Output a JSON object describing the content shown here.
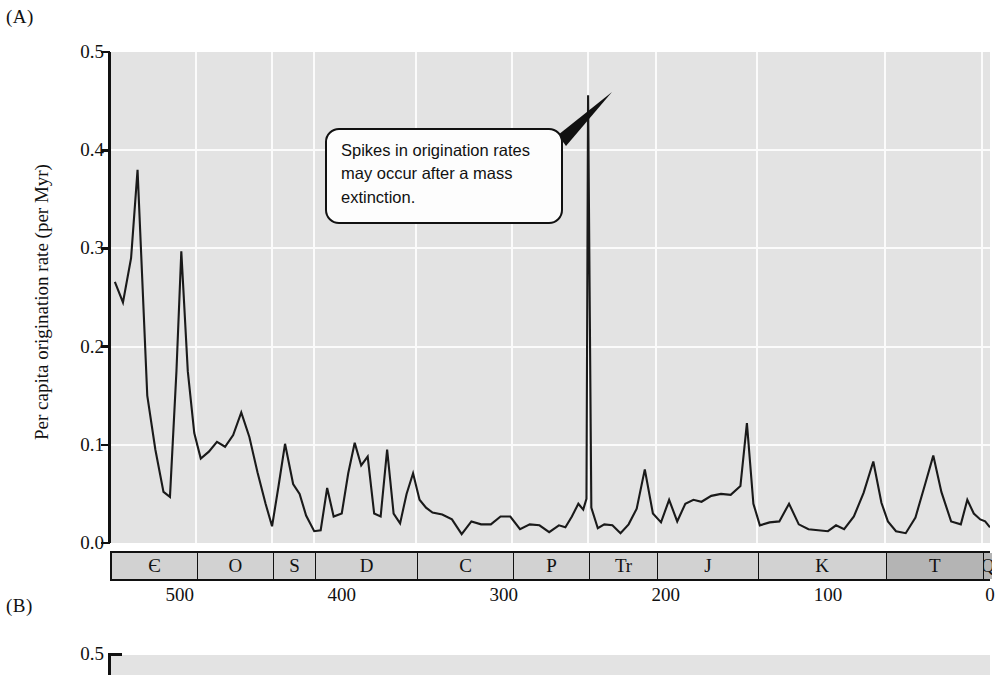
{
  "figure": {
    "panel_a_letter": "(A)",
    "panel_b_letter": "(B)"
  },
  "callout": {
    "text": "Spikes in origination rates may occur after a mass extinction."
  },
  "chart_data": {
    "type": "line",
    "title": "",
    "xlabel": "",
    "ylabel": "Per capita origination rate (per Myr)",
    "xlim": [
      543,
      0
    ],
    "ylim": [
      0.0,
      0.5
    ],
    "x_axis_direction": "reversed",
    "grid": true,
    "legend": null,
    "yticks": [
      "0.5",
      "0.4",
      "0.3",
      "0.2",
      "0.1",
      "0.0"
    ],
    "ytick_values": [
      0.5,
      0.4,
      0.3,
      0.2,
      0.1,
      0.0
    ],
    "xticks": [
      "500",
      "400",
      "300",
      "200",
      "100",
      "0"
    ],
    "xtick_values": [
      500,
      400,
      300,
      200,
      100,
      0
    ],
    "axis_note": "x axis is geological time, millions of years before present",
    "periods": [
      {
        "label": "Є",
        "name": "Cambrian",
        "start": 543,
        "end": 490,
        "shade": "light"
      },
      {
        "label": "O",
        "name": "Ordovician",
        "start": 490,
        "end": 443,
        "shade": "light"
      },
      {
        "label": "S",
        "name": "Silurian",
        "start": 443,
        "end": 417,
        "shade": "light"
      },
      {
        "label": "D",
        "name": "Devonian",
        "start": 417,
        "end": 354,
        "shade": "light"
      },
      {
        "label": "C",
        "name": "Carboniferous",
        "start": 354,
        "end": 295,
        "shade": "light"
      },
      {
        "label": "P",
        "name": "Permian",
        "start": 295,
        "end": 248,
        "shade": "light"
      },
      {
        "label": "Tr",
        "name": "Triassic",
        "start": 248,
        "end": 206,
        "shade": "light"
      },
      {
        "label": "J",
        "name": "Jurassic",
        "start": 206,
        "end": 144,
        "shade": "light"
      },
      {
        "label": "K",
        "name": "Cretaceous",
        "start": 144,
        "end": 65,
        "shade": "light"
      },
      {
        "label": "T",
        "name": "Tertiary",
        "start": 65,
        "end": 5,
        "shade": "dark"
      },
      {
        "label": "Q",
        "name": "Quaternary",
        "start": 5,
        "end": 0,
        "shade": "dark"
      }
    ],
    "series": [
      {
        "name": "Per capita origination rate",
        "color": "#1a1a1a",
        "points": [
          [
            540,
            0.266
          ],
          [
            535,
            0.245
          ],
          [
            530,
            0.29
          ],
          [
            526,
            0.38
          ],
          [
            520,
            0.15
          ],
          [
            515,
            0.095
          ],
          [
            510,
            0.052
          ],
          [
            506,
            0.047
          ],
          [
            502,
            0.175
          ],
          [
            499,
            0.297
          ],
          [
            495,
            0.175
          ],
          [
            491,
            0.112
          ],
          [
            487,
            0.086
          ],
          [
            482,
            0.093
          ],
          [
            477,
            0.103
          ],
          [
            472,
            0.098
          ],
          [
            467,
            0.11
          ],
          [
            462,
            0.133
          ],
          [
            457,
            0.108
          ],
          [
            452,
            0.072
          ],
          [
            447,
            0.04
          ],
          [
            443,
            0.017
          ],
          [
            439,
            0.058
          ],
          [
            435,
            0.101
          ],
          [
            430,
            0.06
          ],
          [
            426,
            0.05
          ],
          [
            422,
            0.028
          ],
          [
            417,
            0.012
          ],
          [
            413,
            0.013
          ],
          [
            409,
            0.056
          ],
          [
            405,
            0.027
          ],
          [
            400,
            0.03
          ],
          [
            396,
            0.071
          ],
          [
            392,
            0.102
          ],
          [
            388,
            0.079
          ],
          [
            384,
            0.088
          ],
          [
            380,
            0.03
          ],
          [
            376,
            0.027
          ],
          [
            372,
            0.095
          ],
          [
            368,
            0.03
          ],
          [
            364,
            0.02
          ],
          [
            360,
            0.05
          ],
          [
            356,
            0.071
          ],
          [
            352,
            0.044
          ],
          [
            348,
            0.036
          ],
          [
            344,
            0.031
          ],
          [
            338,
            0.029
          ],
          [
            332,
            0.024
          ],
          [
            326,
            0.009
          ],
          [
            320,
            0.022
          ],
          [
            314,
            0.019
          ],
          [
            308,
            0.019
          ],
          [
            302,
            0.027
          ],
          [
            296,
            0.027
          ],
          [
            290,
            0.014
          ],
          [
            284,
            0.019
          ],
          [
            278,
            0.018
          ],
          [
            272,
            0.011
          ],
          [
            266,
            0.018
          ],
          [
            262,
            0.016
          ],
          [
            258,
            0.027
          ],
          [
            254,
            0.04
          ],
          [
            251,
            0.034
          ],
          [
            249,
            0.045
          ],
          [
            248,
            0.456
          ],
          [
            246,
            0.036
          ],
          [
            242,
            0.015
          ],
          [
            238,
            0.019
          ],
          [
            233,
            0.018
          ],
          [
            228,
            0.01
          ],
          [
            223,
            0.019
          ],
          [
            218,
            0.035
          ],
          [
            213,
            0.075
          ],
          [
            208,
            0.03
          ],
          [
            203,
            0.021
          ],
          [
            198,
            0.044
          ],
          [
            193,
            0.022
          ],
          [
            188,
            0.04
          ],
          [
            183,
            0.044
          ],
          [
            178,
            0.042
          ],
          [
            172,
            0.048
          ],
          [
            166,
            0.05
          ],
          [
            160,
            0.049
          ],
          [
            154,
            0.058
          ],
          [
            150,
            0.122
          ],
          [
            146,
            0.04
          ],
          [
            142,
            0.018
          ],
          [
            136,
            0.021
          ],
          [
            130,
            0.022
          ],
          [
            124,
            0.04
          ],
          [
            118,
            0.019
          ],
          [
            112,
            0.014
          ],
          [
            106,
            0.013
          ],
          [
            100,
            0.012
          ],
          [
            95,
            0.018
          ],
          [
            90,
            0.014
          ],
          [
            84,
            0.027
          ],
          [
            78,
            0.051
          ],
          [
            72,
            0.083
          ],
          [
            67,
            0.041
          ],
          [
            63,
            0.022
          ],
          [
            58,
            0.012
          ],
          [
            52,
            0.01
          ],
          [
            46,
            0.026
          ],
          [
            40,
            0.06
          ],
          [
            35,
            0.089
          ],
          [
            30,
            0.052
          ],
          [
            24,
            0.022
          ],
          [
            18,
            0.019
          ],
          [
            14,
            0.044
          ],
          [
            10,
            0.03
          ],
          [
            6,
            0.024
          ],
          [
            3,
            0.022
          ],
          [
            0,
            0.016
          ]
        ]
      }
    ]
  },
  "panel_b": {
    "ytick_top": "0.5"
  }
}
